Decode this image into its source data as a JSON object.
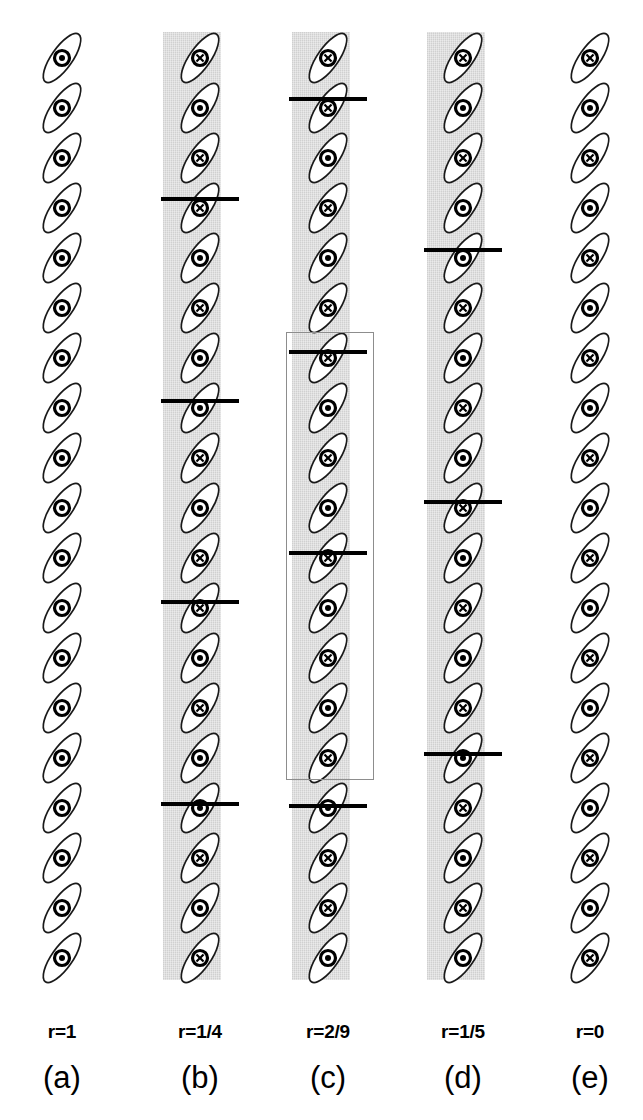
{
  "figure": {
    "width": 643,
    "height": 1120,
    "background_color": "#ffffff",
    "band_color": "#d9d9d9",
    "wall_color": "#000000",
    "cellbox_color": "#8d8d8d",
    "ellipse_stroke": "#1a1a1a",
    "ellipse_fill": "#ffffff"
  },
  "markers": {
    "into_page": "circle-cross-marker",
    "out_of_page": "circle-dot-marker"
  },
  "columns": [
    {
      "id": "a",
      "r_label": "r=1",
      "panel_label": "(a)",
      "center_x": 62,
      "label_x": 62,
      "has_bands": false,
      "has_walls": false,
      "has_cellbox": false,
      "band_x": 34,
      "band_width": 56,
      "start_y": 58,
      "spacing": 50,
      "count": 19,
      "markers": [
        "out",
        "out",
        "out",
        "out",
        "out",
        "out",
        "out",
        "out",
        "out",
        "out",
        "out",
        "out",
        "out",
        "out",
        "out",
        "out",
        "out",
        "out",
        "out"
      ],
      "walls": [],
      "bands": []
    },
    {
      "id": "b",
      "r_label": "r=1/4",
      "panel_label": "(b)",
      "center_x": 200,
      "label_x": 200,
      "has_bands": true,
      "has_walls": true,
      "has_cellbox": false,
      "band_x": 163,
      "band_width": 58,
      "start_y": 58,
      "spacing": 50,
      "count": 19,
      "markers": [
        "into",
        "out",
        "into",
        "into",
        "out",
        "into",
        "out",
        "out",
        "into",
        "out",
        "into",
        "into",
        "out",
        "into",
        "out",
        "out",
        "into",
        "out",
        "into"
      ],
      "walls": [
        197,
        399,
        600,
        802
      ],
      "bands": [
        {
          "y": 32,
          "h": 166
        },
        {
          "y": 198,
          "h": 202
        },
        {
          "y": 400,
          "h": 200
        },
        {
          "y": 600,
          "h": 202
        },
        {
          "y": 802,
          "h": 178
        }
      ]
    },
    {
      "id": "c",
      "r_label": "r=2/9",
      "panel_label": "(c)",
      "center_x": 328,
      "label_x": 328,
      "has_bands": true,
      "has_walls": true,
      "has_cellbox": true,
      "band_x": 292,
      "band_width": 58,
      "start_y": 58,
      "spacing": 50,
      "count": 19,
      "markers": [
        "into",
        "into",
        "out",
        "into",
        "out",
        "into",
        "into",
        "out",
        "into",
        "out",
        "into",
        "out",
        "into",
        "out",
        "into",
        "out",
        "into",
        "into",
        "out"
      ],
      "walls": [
        97,
        350,
        551,
        804
      ],
      "bands": [
        {
          "y": 32,
          "h": 66
        },
        {
          "y": 98,
          "h": 252
        },
        {
          "y": 350,
          "h": 201
        },
        {
          "y": 551,
          "h": 253
        },
        {
          "y": 804,
          "h": 176
        }
      ],
      "cellbox": {
        "x": 286,
        "y": 332,
        "w": 88,
        "h": 448
      }
    },
    {
      "id": "d",
      "r_label": "r=1/5",
      "panel_label": "(d)",
      "center_x": 463,
      "label_x": 463,
      "has_bands": true,
      "has_walls": true,
      "has_cellbox": false,
      "band_x": 427,
      "band_width": 58,
      "start_y": 58,
      "spacing": 50,
      "count": 19,
      "markers": [
        "into",
        "out",
        "into",
        "out",
        "out",
        "into",
        "out",
        "into",
        "out",
        "into",
        "out",
        "into",
        "out",
        "into",
        "out",
        "into",
        "out",
        "into",
        "out"
      ],
      "walls": [
        248,
        500,
        752
      ],
      "bands": [
        {
          "y": 32,
          "h": 217
        },
        {
          "y": 249,
          "h": 251
        },
        {
          "y": 500,
          "h": 252
        },
        {
          "y": 752,
          "h": 228
        }
      ]
    },
    {
      "id": "e",
      "r_label": "r=0",
      "panel_label": "(e)",
      "center_x": 590,
      "label_x": 590,
      "has_bands": false,
      "has_walls": false,
      "has_cellbox": false,
      "band_x": 562,
      "band_width": 56,
      "start_y": 58,
      "spacing": 50,
      "count": 19,
      "markers": [
        "into",
        "out",
        "into",
        "out",
        "into",
        "out",
        "into",
        "out",
        "into",
        "out",
        "into",
        "out",
        "into",
        "out",
        "into",
        "out",
        "into",
        "out",
        "into"
      ],
      "walls": [],
      "bands": []
    }
  ],
  "geometry": {
    "ellipse_rx": 29,
    "ellipse_ry": 10.5,
    "ellipse_rotation_deg": -55,
    "marker_outer_r": 7.5,
    "marker_inner_r": 3.6,
    "wall_half_width": 39,
    "r_label_y": 1022,
    "panel_label_y": 1062
  }
}
